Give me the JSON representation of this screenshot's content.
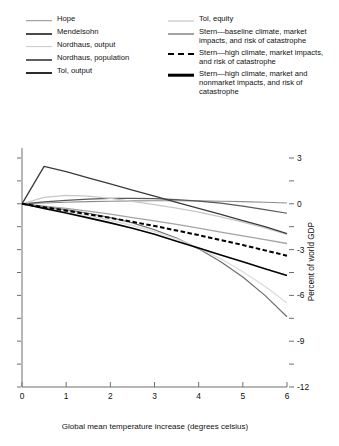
{
  "chart_data": {
    "type": "line",
    "title": "",
    "xlabel": "Global mean temperature increase (degrees celsius)",
    "ylabel": "Percent of world GDP",
    "xlim": [
      0,
      6
    ],
    "ylim": [
      -12,
      3
    ],
    "x_ticks": [
      "0",
      "1",
      "2",
      "3",
      "4",
      "5",
      "6"
    ],
    "x_tick_values": [
      0,
      1,
      2,
      3,
      4,
      5,
      6
    ],
    "y_ticks": [
      "3",
      "",
      "0",
      "",
      "-3",
      "",
      "-6",
      "",
      "-9",
      "",
      "-12"
    ],
    "y_tick_values": [
      3,
      1.5,
      0,
      -1.5,
      -3,
      -4.5,
      -6,
      -7.5,
      -9,
      -10.5,
      -12
    ],
    "y_axis_position": "right",
    "grid": false,
    "legend_position": "top",
    "x": [
      0,
      0.5,
      1,
      1.5,
      2,
      2.5,
      3,
      3.5,
      4,
      4.5,
      5,
      5.5,
      6
    ],
    "series": [
      {
        "name": "Hope",
        "color": "#8d8d8d",
        "width": 1.1,
        "dash": "solid",
        "values": [
          0,
          0.05,
          0.1,
          0.14,
          0.17,
          0.19,
          0.2,
          0.2,
          0.19,
          0.17,
          0.14,
          0.1,
          0.05
        ]
      },
      {
        "name": "Mendelsohn",
        "color": "#595959",
        "width": 1.2,
        "dash": "solid",
        "values": [
          0,
          0.12,
          0.22,
          0.3,
          0.35,
          0.36,
          0.34,
          0.28,
          0.18,
          0.04,
          -0.15,
          -0.38,
          -0.62
        ]
      },
      {
        "name": "Nordhaus, output",
        "color": "#c8c8c8",
        "width": 1.3,
        "dash": "solid",
        "values": [
          0,
          0.42,
          0.55,
          0.5,
          0.35,
          0.16,
          -0.05,
          -0.28,
          -0.55,
          -0.85,
          -1.2,
          -1.58,
          -2.0
        ]
      },
      {
        "name": "Nordhaus, population",
        "color": "#6e6e6e",
        "width": 1.2,
        "dash": "solid",
        "values": [
          0,
          -0.18,
          -0.38,
          -0.62,
          -0.9,
          -1.25,
          -1.7,
          -2.25,
          -2.95,
          -3.8,
          -4.8,
          -6.0,
          -7.4
        ]
      },
      {
        "name": "Tol, output",
        "color": "#3a3a3a",
        "width": 1.3,
        "dash": "solid",
        "values": [
          0,
          2.45,
          2.1,
          1.7,
          1.3,
          0.9,
          0.5,
          0.1,
          -0.3,
          -0.7,
          -1.1,
          -1.5,
          -1.95
        ]
      },
      {
        "name": "Tol, equity",
        "color": "#dcdcdc",
        "width": 1.4,
        "dash": "solid",
        "values": [
          0,
          -0.25,
          -0.5,
          -0.78,
          -1.08,
          -1.42,
          -1.82,
          -2.3,
          -2.9,
          -3.6,
          -4.45,
          -5.4,
          -6.5
        ]
      },
      {
        "name": "Stern—baseline climate, market impacts, and risk of catastrophe",
        "color": "#a3a3a3",
        "width": 1.3,
        "dash": "solid",
        "values": [
          0,
          -0.15,
          -0.3,
          -0.48,
          -0.68,
          -0.9,
          -1.12,
          -1.35,
          -1.6,
          -1.85,
          -2.1,
          -2.35,
          -2.6
        ]
      },
      {
        "name": "Stern—high climate, market impacts, and risk of catastrophe",
        "color": "#000000",
        "width": 2.0,
        "dash": "dashed",
        "values": [
          0,
          -0.22,
          -0.45,
          -0.68,
          -0.92,
          -1.18,
          -1.45,
          -1.75,
          -2.05,
          -2.38,
          -2.7,
          -3.05,
          -3.4
        ]
      },
      {
        "name": "Stern—high climate, market and nonmarket impacts, and risk of catastrophe",
        "color": "#000000",
        "width": 1.6,
        "dash": "solid",
        "values": [
          0,
          -0.3,
          -0.6,
          -0.92,
          -1.25,
          -1.6,
          -2.0,
          -2.45,
          -2.9,
          -3.35,
          -3.8,
          -4.25,
          -4.7
        ]
      }
    ]
  },
  "legend": {
    "left_column": [
      {
        "label": "Hope",
        "color": "#8d8d8d",
        "width": 1.6,
        "dash": "solid"
      },
      {
        "label": "Mendelsohn",
        "color": "#4a4a4a",
        "width": 2.0,
        "dash": "solid"
      },
      {
        "label": "Nordhaus, output",
        "color": "#c8c8c8",
        "width": 1.8,
        "dash": "solid"
      },
      {
        "label": "Nordhaus, population",
        "color": "#5e5e5e",
        "width": 2.0,
        "dash": "solid"
      },
      {
        "label": "Tol, output",
        "color": "#2b2b2b",
        "width": 2.0,
        "dash": "solid"
      }
    ],
    "right_column": [
      {
        "label": "Tol, equity",
        "color": "#dcdcdc",
        "width": 2.0,
        "dash": "solid"
      },
      {
        "label": "Stern—baseline climate, market impacts, and risk of catastrophe",
        "color": "#a3a3a3",
        "width": 2.0,
        "dash": "solid"
      },
      {
        "label": "Stern—high climate, market impacts, and risk of catastrophe",
        "color": "#000000",
        "width": 2.4,
        "dash": "dashed"
      },
      {
        "label": "Stern—high climate, market and nonmarket impacts, and risk of catastrophe",
        "color": "#000000",
        "width": 2.6,
        "dash": "solid"
      }
    ]
  },
  "axes": {
    "x_title": "Global mean temperature increase (degrees celsius)",
    "y_title": "Percent of world GDP"
  }
}
